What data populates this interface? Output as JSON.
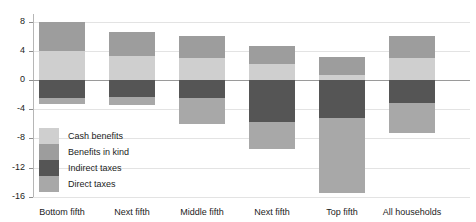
{
  "chart_data": {
    "type": "bar",
    "title": "",
    "subtitle": "",
    "xlabel": "",
    "ylabel": "",
    "stacked": true,
    "grid": true,
    "legend_position": "inside-lower-left",
    "categories": [
      "Bottom fifth",
      "Next fifth",
      "Middle fifth",
      "Next fifth",
      "Top fifth",
      "All households"
    ],
    "ylim": [
      -16,
      9
    ],
    "yticks": [
      8,
      4,
      0,
      -4,
      -8,
      -12,
      -16
    ],
    "ytick_labels": [
      "8",
      "4",
      "0",
      "-4",
      "-8",
      "-12",
      "-16"
    ],
    "series": [
      {
        "name": "Cash benefits",
        "color": "#cfcfcf",
        "values": [
          4.0,
          3.3,
          3.0,
          2.2,
          0.7,
          3.0
        ]
      },
      {
        "name": "Benefits in kind",
        "color": "#9d9d9d",
        "values": [
          4.0,
          3.3,
          3.0,
          2.5,
          2.5,
          3.0
        ]
      },
      {
        "name": "Indirect taxes",
        "color": "#555555",
        "values": [
          -2.5,
          -2.3,
          -2.5,
          -5.7,
          -5.2,
          -3.2
        ]
      },
      {
        "name": "Direct taxes",
        "color": "#a8a8a8",
        "values": [
          -0.8,
          -1.1,
          -3.5,
          -3.8,
          -10.3,
          -4.1
        ]
      }
    ]
  },
  "legend": {
    "items": [
      {
        "label": "Cash benefits"
      },
      {
        "label": "Benefits in kind"
      },
      {
        "label": "Indirect taxes"
      },
      {
        "label": "Direct taxes"
      }
    ]
  },
  "colors": {
    "cash_benefits": "#cfcfcf",
    "benefits_in_kind": "#9d9d9d",
    "indirect_taxes": "#555555",
    "direct_taxes": "#a8a8a8",
    "axis": "#b6b6b6",
    "gridline": "#e3e3e3",
    "zero_line": "#9a9a9a",
    "text": "#1c1c1c"
  }
}
